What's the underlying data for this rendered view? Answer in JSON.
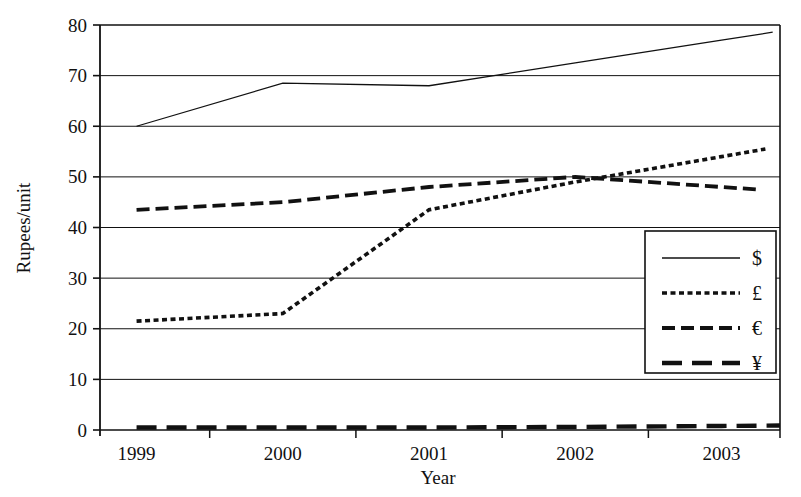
{
  "chart_data": {
    "type": "line",
    "title": "",
    "xlabel": "Year",
    "ylabel": "Rupees/unit",
    "categories": [
      "1999",
      "2000",
      "2001",
      "2002",
      "2003"
    ],
    "x": [
      1999,
      2000,
      2001,
      2002,
      2003
    ],
    "xlim": [
      1998.75,
      2003.4
    ],
    "ylim": [
      0,
      80
    ],
    "yticks": [
      "0",
      "10",
      "20",
      "30",
      "40",
      "50",
      "60",
      "70",
      "80"
    ],
    "ytick_values": [
      0,
      10,
      20,
      30,
      40,
      50,
      60,
      70,
      80
    ],
    "grid": "horizontal",
    "legend_position": "bottom-right",
    "series": [
      {
        "name": "$",
        "style": "solid",
        "color": "#111111",
        "values": [
          60.0,
          68.5,
          68.0,
          72.5,
          77.0
        ],
        "x_end": 2003.35
      },
      {
        "name": "£",
        "style": "dotted",
        "color": "#111111",
        "values": [
          21.5,
          23.0,
          43.5,
          49.0,
          54.0
        ],
        "x_end": 2003.3
      },
      {
        "name": "€",
        "style": "dashed",
        "color": "#111111",
        "values": [
          43.5,
          45.0,
          48.0,
          50.0,
          48.0
        ],
        "x_end": 2003.25
      },
      {
        "name": "¥",
        "style": "long-dash",
        "color": "#111111",
        "values": [
          0.5,
          0.5,
          0.5,
          0.6,
          0.8
        ],
        "x_end": 2003.4
      }
    ]
  },
  "legend": {
    "entries": [
      {
        "label": "$",
        "style": "solid"
      },
      {
        "label": "£",
        "style": "dotted"
      },
      {
        "label": "€",
        "style": "dashed"
      },
      {
        "label": "¥",
        "style": "long-dash"
      }
    ]
  },
  "axes": {
    "y_title": "Rupees/unit",
    "x_title": "Year"
  }
}
